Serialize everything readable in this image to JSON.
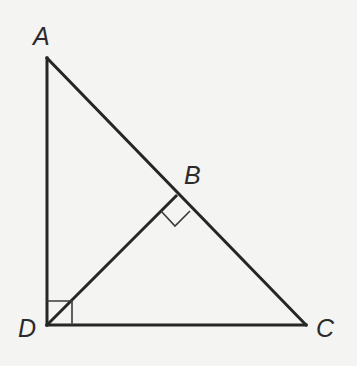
{
  "diagram": {
    "type": "geometry",
    "colors": {
      "background": "#f4f4f2",
      "stroke": "#262626",
      "label": "#2b2b2b"
    },
    "points": {
      "A": {
        "label": "A",
        "x": 47,
        "y": 58
      },
      "B": {
        "label": "B",
        "x": 176,
        "y": 196
      },
      "C": {
        "label": "C",
        "x": 306,
        "y": 325
      },
      "D": {
        "label": "D",
        "x": 47,
        "y": 325
      }
    },
    "segments": [
      {
        "from": "A",
        "to": "D"
      },
      {
        "from": "D",
        "to": "C"
      },
      {
        "from": "A",
        "to": "C"
      },
      {
        "from": "D",
        "to": "B"
      }
    ],
    "right_angles": [
      {
        "at": "D",
        "between": [
          "A",
          "C"
        ]
      },
      {
        "at": "B",
        "between": [
          "D",
          "C"
        ]
      }
    ],
    "labels": {
      "A": "A",
      "B": "B",
      "C": "C",
      "D": "D"
    }
  }
}
